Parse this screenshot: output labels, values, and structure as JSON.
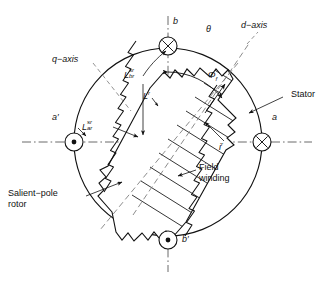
{
  "diagram": {
    "type": "machine-cross-section",
    "stator": {
      "label": "Stator",
      "circle": {
        "cx": 168,
        "cy": 142,
        "r": 94
      }
    },
    "rotor": {
      "label_line1": "Salient−pole",
      "label_line2": "rotor",
      "tilt_degrees": 32
    },
    "field_winding": {
      "label_line1": "Field",
      "label_line2": "winding",
      "turns": 11
    },
    "axes": {
      "d_axis_label": "d−axis",
      "q_axis_label": "q−axis",
      "theta_label": "θ"
    },
    "coils": [
      {
        "name": "a",
        "label": "a",
        "marker": "cross-circle-icon",
        "x": 262,
        "y": 142
      },
      {
        "name": "a'",
        "label": "a′",
        "marker": "dot-circle-icon",
        "x": 74,
        "y": 142
      },
      {
        "name": "b",
        "label": "b",
        "marker": "cross-circle-icon",
        "x": 168,
        "y": 46
      },
      {
        "name": "b'",
        "label": "b′",
        "marker": "dot-circle-icon",
        "x": 168,
        "y": 240
      }
    ],
    "quantities": [
      {
        "name": "mutual-inductance-br",
        "base": "L",
        "superscript": "sr",
        "subscript": "br"
      },
      {
        "name": "mutual-inductance-ar",
        "base": "L",
        "superscript": "sr",
        "subscript": "ar"
      },
      {
        "name": "rotor-self-inductance",
        "base": "L",
        "superscript": "r",
        "subscript": ""
      },
      {
        "name": "field-flux",
        "base": "Φ",
        "superscript": "",
        "subscript": "f"
      },
      {
        "name": "field-current",
        "base": "i",
        "superscript": "r",
        "subscript": ""
      }
    ]
  }
}
